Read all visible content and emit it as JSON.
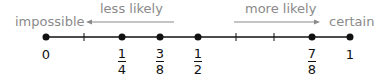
{
  "labels": {
    "left_end": "impossible",
    "right_end": "certain",
    "left_arrow": "less likely",
    "right_arrow": "more likely"
  },
  "colors": {
    "line": "#111111",
    "label_gray": "#8a8a8a",
    "arrow_gray": "#8a8a8a"
  },
  "points": [
    {
      "value": "0",
      "num": "",
      "den": "",
      "x": 46,
      "dot": true
    },
    {
      "value": "",
      "num": "1",
      "den": "4",
      "x": 122,
      "dot": true
    },
    {
      "value": "",
      "num": "3",
      "den": "8",
      "x": 160,
      "dot": true
    },
    {
      "value": "",
      "num": "1",
      "den": "2",
      "x": 198,
      "dot": true
    },
    {
      "value": "",
      "num": "7",
      "den": "8",
      "x": 312,
      "dot": true
    },
    {
      "value": "1",
      "num": "",
      "den": "",
      "x": 350,
      "dot": true
    }
  ],
  "ticks": [
    84,
    236,
    274
  ]
}
